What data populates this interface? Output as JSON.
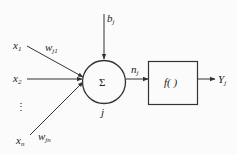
{
  "diagram": {
    "type": "artificial-neuron-model",
    "inputs": [
      {
        "name": "x",
        "sub": "1"
      },
      {
        "name": "x",
        "sub": "2"
      },
      {
        "name": "⋮",
        "sub": ""
      },
      {
        "name": "x",
        "sub": "n"
      }
    ],
    "weights": [
      {
        "name": "w",
        "sub": "j1"
      },
      {
        "name": "w",
        "sub": "jn"
      }
    ],
    "bias": {
      "name": "b",
      "sub": "j"
    },
    "summation": {
      "symbol": "Σ",
      "node_label": "j"
    },
    "net_input": {
      "name": "n",
      "sub": "j"
    },
    "activation": {
      "label": "f( )"
    },
    "output": {
      "name": "Y",
      "sub": "j"
    },
    "colors": {
      "stroke": "#333333",
      "background": "#fbfbfb",
      "text": "#222222"
    }
  }
}
